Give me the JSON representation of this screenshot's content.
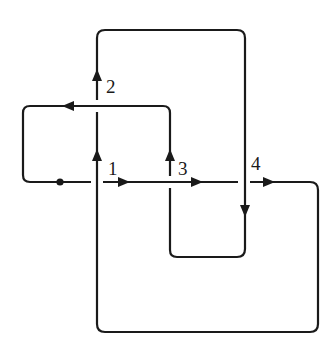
{
  "diagram": {
    "type": "oriented knot diagram",
    "stroke_color": "#1a1a1a",
    "background": "#ffffff",
    "basepoint": {
      "x": 60,
      "y": 182
    },
    "crossings": [
      {
        "label": "1",
        "x": 97,
        "y": 182,
        "over": "vertical",
        "label_x": 108,
        "label_y": 175
      },
      {
        "label": "2",
        "x": 97,
        "y": 106,
        "over": "horizontal",
        "label_x": 106,
        "label_y": 93
      },
      {
        "label": "3",
        "x": 170,
        "y": 182,
        "over": "horizontal",
        "label_x": 178,
        "label_y": 175
      },
      {
        "label": "4",
        "x": 244,
        "y": 182,
        "over": "vertical",
        "label_x": 251,
        "label_y": 170
      }
    ]
  }
}
